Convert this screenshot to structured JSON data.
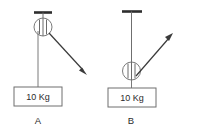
{
  "figure": {
    "background_color": "#ffffff",
    "line_color": "#6f6f6f",
    "arrow_color": "#3a3a3a",
    "text_color": "#2b2b2b",
    "ceiling_color": "#2e2e2e"
  },
  "panels": [
    {
      "id": "panel-a",
      "letter": "A",
      "mass_label": "10 Kg",
      "pulley_type": "fixed-pulley-at-ceiling",
      "force_direction": "down-right",
      "ceiling_bar": {
        "x1": 34,
        "y1": 12,
        "x2": 52,
        "y2": 12
      },
      "hanger": {
        "x1": 43,
        "y1": 12,
        "x2": 43,
        "y2": 20
      },
      "pulley": {
        "cx": 43,
        "cy": 27,
        "r": 9
      },
      "load_rope": {
        "x1": 38,
        "y1": 31,
        "x2": 38,
        "y2": 87
      },
      "pull_rope": {
        "x1": 48,
        "y1": 31,
        "x2": 86,
        "y2": 73
      },
      "arrow_tip": {
        "x": 86,
        "y": 73
      },
      "mass_box": {
        "x": 14,
        "y": 87,
        "w": 48,
        "h": 19
      },
      "letter_pos": {
        "x": 38,
        "y": 124
      }
    },
    {
      "id": "panel-b",
      "letter": "B",
      "mass_label": "10 Kg",
      "pulley_type": "movable-pulley-at-load",
      "force_direction": "up-right",
      "ceiling_bar": {
        "x1": 122,
        "y1": 11,
        "x2": 142,
        "y2": 11
      },
      "hanger": {
        "x1": 132,
        "y1": 11,
        "x2": 132,
        "y2": 62
      },
      "pulley": {
        "cx": 132,
        "cy": 71,
        "r": 9
      },
      "load_rope": {
        "x1": 132,
        "y1": 80,
        "x2": 132,
        "y2": 88
      },
      "pull_rope": {
        "x1": 137,
        "y1": 76,
        "x2": 172,
        "y2": 35
      },
      "arrow_tip": {
        "x": 172,
        "y": 35
      },
      "mass_box": {
        "x": 108,
        "y": 88,
        "w": 48,
        "h": 19
      },
      "letter_pos": {
        "x": 131,
        "y": 124
      }
    }
  ]
}
